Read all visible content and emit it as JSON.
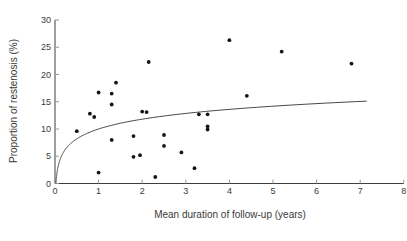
{
  "figure": {
    "background": "#ffffff",
    "axis_color": "#3f3f3f",
    "tick_color": "#999999",
    "text_color": "#3a3a3a",
    "point_color": "#151515",
    "curve_color": "#333333"
  },
  "chart_data": {
    "type": "scatter",
    "title": "",
    "xlabel": "Mean duration of follow-up (years)",
    "ylabel": "Proportion of restenosis (%)",
    "xlim": [
      0,
      8
    ],
    "ylim": [
      0,
      30
    ],
    "x_ticks": [
      0,
      1,
      2,
      3,
      4,
      5,
      6,
      7,
      8
    ],
    "y_ticks": [
      0,
      5,
      10,
      15,
      20,
      25,
      30
    ],
    "grid": false,
    "legend": null,
    "points": [
      [
        0.5,
        9.6
      ],
      [
        0.8,
        12.8
      ],
      [
        0.9,
        12.2
      ],
      [
        1.0,
        16.7
      ],
      [
        1.0,
        2.0
      ],
      [
        1.3,
        8.0
      ],
      [
        1.3,
        14.5
      ],
      [
        1.3,
        16.5
      ],
      [
        1.4,
        18.5
      ],
      [
        1.8,
        8.7
      ],
      [
        1.8,
        4.9
      ],
      [
        1.95,
        5.2
      ],
      [
        2.0,
        13.2
      ],
      [
        2.1,
        13.1
      ],
      [
        2.15,
        22.3
      ],
      [
        2.3,
        1.2
      ],
      [
        2.5,
        8.9
      ],
      [
        2.5,
        6.9
      ],
      [
        2.9,
        5.7
      ],
      [
        3.2,
        2.8
      ],
      [
        3.3,
        12.7
      ],
      [
        3.5,
        12.7
      ],
      [
        3.5,
        10.5
      ],
      [
        3.5,
        9.9
      ],
      [
        4.0,
        26.3
      ],
      [
        4.4,
        16.1
      ],
      [
        5.2,
        24.2
      ],
      [
        6.8,
        22.0
      ]
    ],
    "curve": {
      "type": "log-fit",
      "formula": "y = 10 + 2.6*ln(x)",
      "a": 10,
      "b": 2.6,
      "x_start": 0.0214,
      "x_end": 7.15
    }
  }
}
